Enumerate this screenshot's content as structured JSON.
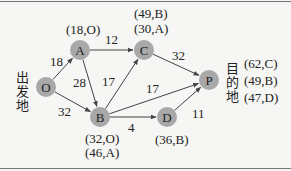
{
  "diagram": {
    "type": "network",
    "colors": {
      "node_fill": "#a8a8a8",
      "edge": "#444444",
      "text": "#222222",
      "background": "#f6f6f4"
    },
    "nodes": [
      {
        "id": "O",
        "label": "O",
        "x": 46,
        "y": 87
      },
      {
        "id": "A",
        "label": "A",
        "x": 80,
        "y": 50
      },
      {
        "id": "C",
        "label": "C",
        "x": 144,
        "y": 50
      },
      {
        "id": "B",
        "label": "B",
        "x": 100,
        "y": 117
      },
      {
        "id": "D",
        "label": "D",
        "x": 167,
        "y": 117
      },
      {
        "id": "P",
        "label": "P",
        "x": 209,
        "y": 80
      }
    ],
    "edges": [
      {
        "from": "O",
        "to": "A",
        "weight": "18"
      },
      {
        "from": "O",
        "to": "B",
        "weight": "32"
      },
      {
        "from": "A",
        "to": "C",
        "weight": "12"
      },
      {
        "from": "A",
        "to": "B",
        "weight": "28"
      },
      {
        "from": "B",
        "to": "C",
        "weight": "17"
      },
      {
        "from": "B",
        "to": "P",
        "weight": "17"
      },
      {
        "from": "B",
        "to": "D",
        "weight": "4"
      },
      {
        "from": "C",
        "to": "P",
        "weight": "32"
      },
      {
        "from": "D",
        "to": "P",
        "weight": "11"
      }
    ],
    "node_annotations": {
      "A": [
        "(18,O)"
      ],
      "C": [
        "(49,B)",
        "(30,A)"
      ],
      "B": [
        "(32,O)",
        "(46,A)"
      ],
      "D": [
        "(36,B)"
      ],
      "P": [
        "(62,C)",
        "(49,B)",
        "(47,D)"
      ]
    },
    "origin_label": [
      "出",
      "发",
      "地"
    ],
    "destination_label": [
      "目",
      "的",
      "地"
    ]
  }
}
